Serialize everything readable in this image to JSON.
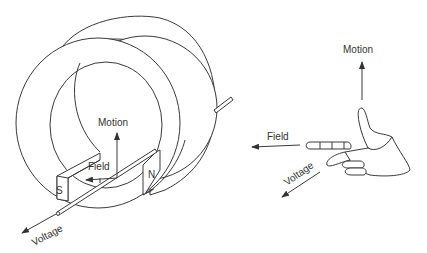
{
  "generator": {
    "labels": {
      "motion": "Motion",
      "field": "Field",
      "voltage": "Voltage",
      "south_pole": "S",
      "north_pole": "N"
    }
  },
  "right_hand_rule": {
    "labels": {
      "motion": "Motion",
      "field": "Field",
      "voltage": "Voltage"
    }
  },
  "colors": {
    "line": "#3a3a3a",
    "text": "#333333",
    "background": "#ffffff"
  }
}
